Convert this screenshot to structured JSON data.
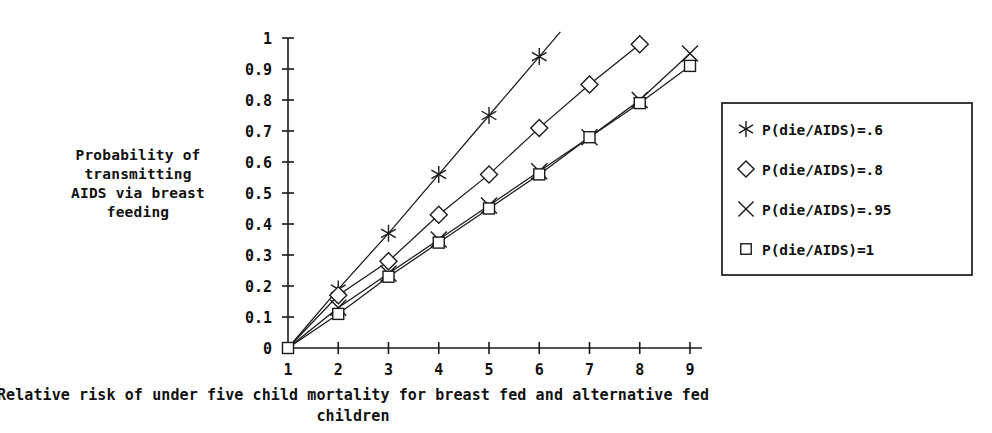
{
  "chart_data": {
    "type": "line",
    "title": "",
    "xlabel": "Relative risk of under five child mortality for breast fed and alternative fed children",
    "ylabel": "Probability of transmitting AIDS via breast feeding",
    "x": [
      1,
      2,
      3,
      4,
      5,
      6,
      7,
      8,
      9
    ],
    "xlim": [
      1,
      9
    ],
    "ylim": [
      0,
      1
    ],
    "xticks": [
      "1",
      "2",
      "3",
      "4",
      "5",
      "6",
      "7",
      "8",
      "9"
    ],
    "yticks": [
      "0",
      "0.1",
      "0.2",
      "0.3",
      "0.4",
      "0.5",
      "0.6",
      "0.7",
      "0.8",
      "0.9",
      "1"
    ],
    "grid": false,
    "legend_position": "right",
    "series": [
      {
        "name": "P(die/AIDS)=.6",
        "marker": "asterisk",
        "x": [
          1,
          2,
          3,
          4,
          5,
          6
        ],
        "values": [
          0,
          0.19,
          0.37,
          0.56,
          0.75,
          0.94
        ]
      },
      {
        "name": "P(die/AIDS)=.8",
        "marker": "diamond",
        "x": [
          1,
          2,
          3,
          4,
          5,
          6,
          7,
          8
        ],
        "values": [
          0,
          0.17,
          0.28,
          0.43,
          0.56,
          0.71,
          0.85,
          0.98
        ]
      },
      {
        "name": "P(die/AIDS)=.95",
        "marker": "cross",
        "x": [
          1,
          2,
          3,
          4,
          5,
          6,
          7,
          8,
          9
        ],
        "values": [
          0,
          0.13,
          0.24,
          0.35,
          0.46,
          0.57,
          0.68,
          0.8,
          0.95
        ]
      },
      {
        "name": "P(die/AIDS)=1",
        "marker": "square",
        "x": [
          1,
          2,
          3,
          4,
          5,
          6,
          7,
          8,
          9
        ],
        "values": [
          0,
          0.11,
          0.23,
          0.34,
          0.45,
          0.56,
          0.68,
          0.79,
          0.91
        ]
      }
    ]
  },
  "axis_titles": {
    "y_lines": [
      "Probability of",
      "transmitting",
      "AIDS via breast",
      "feeding"
    ],
    "x_lines": [
      "Relative risk of under five child mortality for breast fed and alternative fed",
      "children"
    ]
  },
  "legend": {
    "items": [
      {
        "marker": "asterisk",
        "label": "P(die/AIDS)=.6"
      },
      {
        "marker": "diamond",
        "label": "P(die/AIDS)=.8"
      },
      {
        "marker": "cross",
        "label": "P(die/AIDS)=.95"
      },
      {
        "marker": "square",
        "label": "P(die/AIDS)=1"
      }
    ]
  },
  "colors": {
    "ink": "#1a1a1a",
    "background": "#ffffff",
    "marker_fill": "#ffffff"
  }
}
